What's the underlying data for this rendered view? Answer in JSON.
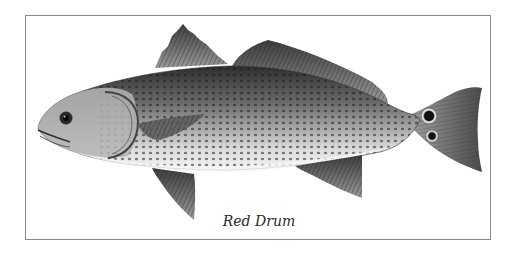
{
  "figure": {
    "caption": "Red Drum",
    "colors": {
      "frame": "#8a8a8a",
      "background": "#ffffff",
      "body_dark": "#3a3a3a",
      "body_mid": "#8c8c8c",
      "belly": "#eeeeee",
      "tail_spot": "#111111"
    }
  }
}
